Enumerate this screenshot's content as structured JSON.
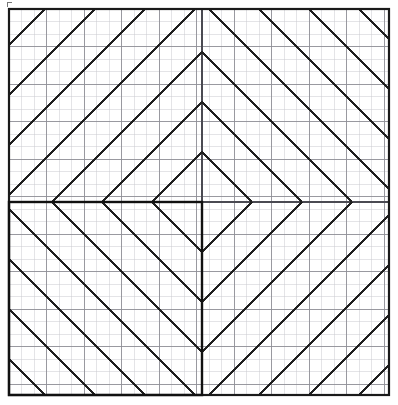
{
  "figure": {
    "canvas": {
      "width": 398,
      "height": 405
    },
    "background_color": "#ffffff"
  },
  "grid": {
    "origin_x": 9,
    "origin_y": 9,
    "width": 380,
    "height": 386,
    "cell_size": 12.5,
    "minor_color": "#c9c9cf",
    "minor_width": 0.5,
    "major_every": 3,
    "major_color": "#8e8e96",
    "major_width": 0.9,
    "columns": 31,
    "rows": 31
  },
  "outer_border": {
    "color": "#1a1a1a",
    "width": 2.2,
    "x": 9,
    "y": 9,
    "w": 380,
    "h": 386
  },
  "center": {
    "x": 202,
    "y": 202
  },
  "hatching": {
    "color": "#1f1f1f",
    "width": 1.7,
    "spacing": 50,
    "quadrants": [
      {
        "name": "top-left",
        "direction": "up-right"
      },
      {
        "name": "top-right",
        "direction": "down-right"
      },
      {
        "name": "bottom-left",
        "direction": "down-right"
      },
      {
        "name": "bottom-right",
        "direction": "up-right"
      }
    ],
    "note": "Diagonals mirror across the horizontal and vertical center axes, producing nested chevrons and diamonds."
  },
  "center_axes": {
    "color": "#4a4a52",
    "width": 1.1,
    "vertical_x": 202,
    "horizontal_y": 202
  },
  "bold_rectangle": {
    "x": 9,
    "y": 202,
    "w": 193,
    "h": 193,
    "color": "#111111",
    "width": 2.4,
    "quadrant": "bottom-left"
  },
  "corner_tick": {
    "x": 7,
    "y": 2,
    "length": 5,
    "color": "#777777"
  },
  "chart_data": {
    "type": "line",
    "xlabel": "",
    "ylabel": "",
    "xlim": [
      0,
      31
    ],
    "ylim": [
      0,
      31
    ],
    "grid": true,
    "legend": "none",
    "series": [
      {
        "name": "hatch-top-left",
        "values": [
          50,
          100,
          150,
          200
        ]
      },
      {
        "name": "hatch-top-right",
        "values": [
          50,
          100,
          150,
          200
        ]
      },
      {
        "name": "hatch-bottom-left",
        "values": [
          50,
          100,
          150,
          200
        ]
      },
      {
        "name": "hatch-bottom-right",
        "values": [
          50,
          100,
          150,
          200
        ]
      }
    ],
    "annotations": [
      "nested chevron apexes at y = 35, 90, 152, 177",
      "center diamond centered at (202, 202)",
      "bold rectangle occupies lower-left quadrant"
    ]
  }
}
